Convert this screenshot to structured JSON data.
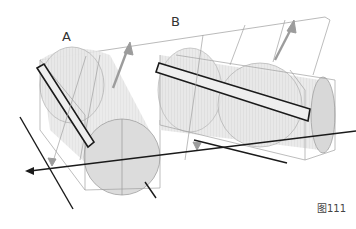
{
  "figure": {
    "caption": "图111",
    "labels": {
      "a": "A",
      "b": "B"
    },
    "colors": {
      "outline_dark": "#1a1a1a",
      "outline_light": "#9a9a9a",
      "arrow_gray": "#9c9c9c",
      "cylinder_fill": "#e4e4e4",
      "cylinder_end_fill": "#dadada"
    }
  }
}
